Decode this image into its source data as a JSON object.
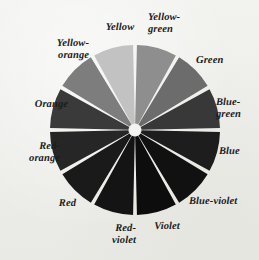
{
  "figure": {
    "kind": "color-wheel",
    "background_color": "#efefec",
    "gap_color": "#f4f4f1",
    "outline_color": "#d8d8d4",
    "label_color": "#1b1b1b",
    "center": {
      "x": 135,
      "y": 130
    },
    "radius": 85,
    "hub_radius": 5
  },
  "chart_data": {
    "type": "pie",
    "xlabel": "",
    "ylabel": "",
    "legend_position": "around-wedges",
    "grid": false,
    "note": "Twelve equal hue wedges reproduced in grayscale halftone; each slice is 30 degrees.",
    "categories": [
      "Yellow-green",
      "Green",
      "Blue-green",
      "Blue",
      "Blue-violet",
      "Violet",
      "Red-violet",
      "Red",
      "Red-orange",
      "Orange",
      "Yellow-orange",
      "Yellow"
    ],
    "values": [
      8.333,
      8.333,
      8.333,
      8.333,
      8.333,
      8.333,
      8.333,
      8.333,
      8.333,
      8.333,
      8.333,
      8.333
    ],
    "wedges": [
      {
        "label": "Yellow-green",
        "label_lines": "Yellow-\ngreen",
        "start_angle": 0,
        "end_angle": 30,
        "gray": "#8e8e8e"
      },
      {
        "label": "Green",
        "label_lines": "Green",
        "start_angle": 30,
        "end_angle": 60,
        "gray": "#6c6c6c"
      },
      {
        "label": "Blue-green",
        "label_lines": "Blue-\ngreen",
        "start_angle": 60,
        "end_angle": 90,
        "gray": "#383838"
      },
      {
        "label": "Blue",
        "label_lines": "Blue",
        "start_angle": 90,
        "end_angle": 120,
        "gray": "#1d1d1d"
      },
      {
        "label": "Blue-violet",
        "label_lines": "Blue-violet",
        "start_angle": 120,
        "end_angle": 150,
        "gray": "#111111"
      },
      {
        "label": "Violet",
        "label_lines": "Violet",
        "start_angle": 150,
        "end_angle": 180,
        "gray": "#0d0d0d"
      },
      {
        "label": "Red-violet",
        "label_lines": "Red-\nviolet",
        "start_angle": 180,
        "end_angle": 210,
        "gray": "#141414"
      },
      {
        "label": "Red",
        "label_lines": "Red",
        "start_angle": 210,
        "end_angle": 240,
        "gray": "#1a1a1a"
      },
      {
        "label": "Red-orange",
        "label_lines": "Red-\norange",
        "start_angle": 240,
        "end_angle": 270,
        "gray": "#262626"
      },
      {
        "label": "Orange",
        "label_lines": "Orange",
        "start_angle": 270,
        "end_angle": 300,
        "gray": "#3a3a3a"
      },
      {
        "label": "Yellow-orange",
        "label_lines": "Yellow-\norange",
        "start_angle": 300,
        "end_angle": 330,
        "gray": "#7d7d7d"
      },
      {
        "label": "Yellow",
        "label_lines": "Yellow",
        "start_angle": 330,
        "end_angle": 360,
        "gray": "#c2c2c2"
      }
    ]
  },
  "labels": [
    {
      "name": "label-yellow",
      "text": "Yellow",
      "x": 94,
      "y": 22,
      "w": 52,
      "align": "mid"
    },
    {
      "name": "label-yellow-green",
      "text": "Yellow-\ngreen",
      "x": 148,
      "y": 12,
      "w": 60,
      "align": "right"
    },
    {
      "name": "label-green",
      "text": "Green",
      "x": 196,
      "y": 55,
      "w": 50,
      "align": "right"
    },
    {
      "name": "label-blue-green",
      "text": "Blue-\ngreen",
      "x": 216,
      "y": 97,
      "w": 42,
      "align": "right"
    },
    {
      "name": "label-blue",
      "text": "Blue",
      "x": 219,
      "y": 146,
      "w": 38,
      "align": "right"
    },
    {
      "name": "label-blue-violet",
      "text": "Blue-violet",
      "x": 189,
      "y": 196,
      "w": 70,
      "align": "right"
    },
    {
      "name": "label-violet",
      "text": "Violet",
      "x": 144,
      "y": 221,
      "w": 46,
      "align": "mid"
    },
    {
      "name": "label-red-violet",
      "text": "Red-\nviolet",
      "x": 92,
      "y": 223,
      "w": 44,
      "align": "left"
    },
    {
      "name": "label-red",
      "text": "Red",
      "x": 42,
      "y": 198,
      "w": 34,
      "align": "left"
    },
    {
      "name": "label-red-orange",
      "text": "Red-\norange",
      "x": 12,
      "y": 141,
      "w": 48,
      "align": "left"
    },
    {
      "name": "label-orange",
      "text": "Orange",
      "x": 16,
      "y": 99,
      "w": 52,
      "align": "left"
    },
    {
      "name": "label-yellow-orange",
      "text": "Yellow-\norange",
      "x": 33,
      "y": 38,
      "w": 56,
      "align": "left"
    }
  ]
}
